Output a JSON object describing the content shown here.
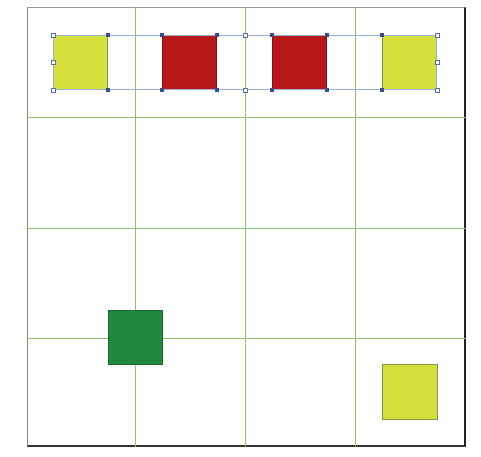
{
  "caption": {
    "text": ""
  },
  "colors": {
    "grid_line": "#8cc46a",
    "frame_border": "#222222",
    "yellow": "#d6e03c",
    "red": "#b81818",
    "green": "#1f8a3c",
    "selection": "#9ab0d8",
    "handle": "#3a4f88"
  },
  "grid": {
    "columns": 4,
    "rows": 4,
    "frame": {
      "left": 27,
      "top": 7,
      "right": 466,
      "bottom": 447
    },
    "vertical_lines_x": [
      135,
      245,
      355
    ],
    "horizontal_lines_y": [
      117,
      228,
      338
    ]
  },
  "shapes": [
    {
      "name": "yellow-square-1",
      "color": "yellow",
      "x": 53,
      "y": 35,
      "w": 55,
      "h": 55,
      "selected": true
    },
    {
      "name": "red-square-1",
      "color": "red",
      "x": 162,
      "y": 35,
      "w": 55,
      "h": 55,
      "selected": true
    },
    {
      "name": "red-square-2",
      "color": "red",
      "x": 272,
      "y": 35,
      "w": 55,
      "h": 55,
      "selected": true
    },
    {
      "name": "yellow-square-2",
      "color": "yellow",
      "x": 382,
      "y": 35,
      "w": 55,
      "h": 55,
      "selected": true
    },
    {
      "name": "green-square",
      "color": "green",
      "x": 108,
      "y": 310,
      "w": 55,
      "h": 55,
      "selected": false
    },
    {
      "name": "yellow-square-3",
      "color": "yellow",
      "x": 382,
      "y": 364,
      "w": 56,
      "h": 56,
      "selected": false
    }
  ],
  "selection": {
    "x": 53,
    "y": 35,
    "w": 384,
    "h": 55,
    "open_handles": [
      [
        53,
        35
      ],
      [
        53,
        62
      ],
      [
        53,
        90
      ],
      [
        245,
        35
      ],
      [
        245,
        90
      ],
      [
        437,
        35
      ],
      [
        437,
        62
      ],
      [
        437,
        90
      ]
    ],
    "anchor_points": [
      [
        108,
        35
      ],
      [
        108,
        90
      ],
      [
        162,
        35
      ],
      [
        162,
        90
      ],
      [
        217,
        35
      ],
      [
        217,
        90
      ],
      [
        272,
        35
      ],
      [
        272,
        90
      ],
      [
        327,
        35
      ],
      [
        327,
        90
      ],
      [
        382,
        35
      ],
      [
        382,
        90
      ]
    ]
  }
}
